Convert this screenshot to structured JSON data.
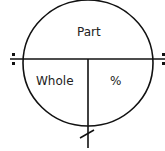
{
  "diagram": {
    "type": "percent-circle",
    "labels": {
      "top": "Part",
      "bottom_left": "Whole",
      "bottom_right": "%"
    },
    "operators": {
      "left_divide": "divide-marker-icon",
      "right_divide": "divide-marker-icon",
      "bottom_multiply": "multiply-slash-icon"
    },
    "colors": {
      "stroke": "#111111",
      "background": "#ffffff",
      "text": "#222222"
    }
  }
}
